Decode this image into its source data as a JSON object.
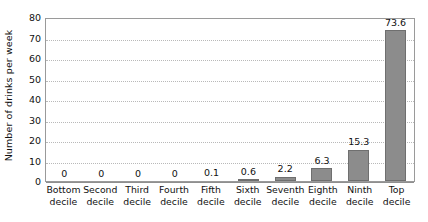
{
  "chart_data": {
    "type": "bar",
    "title": "",
    "xlabel": "",
    "ylabel": "Number of drinks per week",
    "ylim": [
      0,
      80
    ],
    "ytick_step": 10,
    "yticks": [
      80,
      70,
      60,
      50,
      40,
      30,
      20,
      10,
      0
    ],
    "grid": true,
    "legend": false,
    "orientation": "vertical",
    "categories": [
      "Bottom decile",
      "Second decile",
      "Third decile",
      "Fourth decile",
      "Fifth decile",
      "Sixth decile",
      "Seventh decile",
      "Eighth decile",
      "Ninth decile",
      "Top decile"
    ],
    "category_lines": [
      [
        "Bottom",
        "decile"
      ],
      [
        "Second",
        "decile"
      ],
      [
        "Third",
        "decile"
      ],
      [
        "Fourth",
        "decile"
      ],
      [
        "Fifth",
        "decile"
      ],
      [
        "Sixth",
        "decile"
      ],
      [
        "Seventh",
        "decile"
      ],
      [
        "Eighth",
        "decile"
      ],
      [
        "Ninth",
        "decile"
      ],
      [
        "Top",
        "decile"
      ]
    ],
    "values": [
      0,
      0,
      0,
      0,
      0.1,
      0.6,
      2.2,
      6.3,
      15.3,
      73.6
    ],
    "value_labels": [
      "0",
      "0",
      "0",
      "0",
      "0.1",
      "0.6",
      "2.2",
      "6.3",
      "15.3",
      "73.6"
    ],
    "colors": {
      "bar_fill": "#8c8c8c",
      "bar_stroke": "#6f6f6f",
      "gridline": "#b9b9b9",
      "frame": "#9a9a9a",
      "text": "#111111",
      "background": "#ffffff"
    }
  }
}
